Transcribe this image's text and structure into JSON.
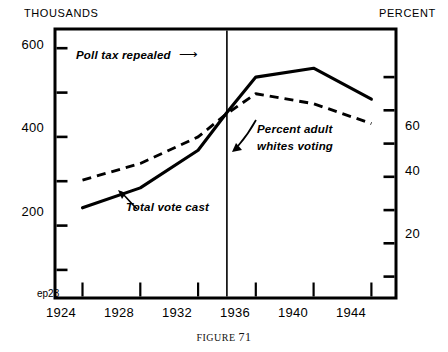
{
  "figure": {
    "caption_prefix": "FIGURE",
    "caption_number": "71",
    "corner_tag": "ep23"
  },
  "header": {
    "left_axis_unit": "THOUSANDS",
    "right_axis_unit": "PERCENT"
  },
  "annotations": [
    {
      "name": "poll-tax-repealed",
      "text": "Poll tax repealed",
      "arrow": "⟶"
    },
    {
      "name": "percent-adult-whites-voting",
      "line1": "Percent adult",
      "line2": "whites voting"
    },
    {
      "name": "total-vote-cast",
      "text": "Total vote cast"
    }
  ],
  "chart_data": {
    "type": "line",
    "title": "",
    "xlabel": "",
    "ylabel": "THOUSANDS",
    "y2label": "PERCENT",
    "x": [
      1924,
      1928,
      1932,
      1934,
      1936,
      1940,
      1944
    ],
    "xlim": [
      1922.2,
      1945.6
    ],
    "xticks": [
      1924,
      1928,
      1932,
      1936,
      1940,
      1944
    ],
    "xticklabels": [
      "1924",
      "1928",
      "1932",
      "1936",
      "1940",
      "1944"
    ],
    "ylim": [
      40,
      640
    ],
    "yticks": [
      100,
      200,
      300,
      400,
      500,
      600
    ],
    "yticklabels": [
      "",
      "200",
      "",
      "400",
      "",
      "600"
    ],
    "y2lim": [
      4,
      84
    ],
    "y2ticks": [
      10,
      20,
      30,
      40,
      50,
      60,
      70
    ],
    "y2ticklabels": [
      "",
      "20",
      "",
      "40",
      "",
      "60",
      ""
    ],
    "grid": false,
    "legend": "inline-annotations",
    "vline": {
      "x": 1934,
      "label": "Poll tax repealed"
    },
    "series": [
      {
        "name": "Total vote cast",
        "axis": "left",
        "style": "solid",
        "values": [
          240,
          285,
          370,
          455,
          535,
          555,
          485
        ]
      },
      {
        "name": "Percent adult whites voting",
        "axis": "right",
        "style": "dashed",
        "values": [
          39,
          44,
          52,
          59,
          65,
          62,
          56
        ]
      }
    ]
  }
}
